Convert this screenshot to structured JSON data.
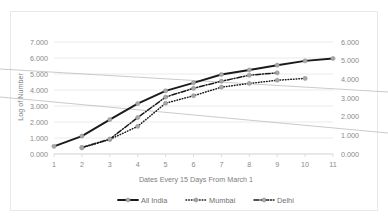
{
  "chart_data": {
    "type": "line",
    "title": "",
    "xlabel": "Dates Every 15 Days From March 1",
    "ylabel": "Log of Number",
    "y2label": "",
    "x": [
      1,
      2,
      3,
      4,
      5,
      6,
      7,
      8,
      9,
      10,
      11
    ],
    "categories": [
      "1",
      "2",
      "3",
      "4",
      "5",
      "6",
      "7",
      "8",
      "9",
      "10",
      "11"
    ],
    "xlim": [
      1,
      11
    ],
    "ylim": [
      0,
      7
    ],
    "y2lim": [
      0,
      6
    ],
    "ytick_labels": [
      "0.000",
      "1.000",
      "2.000",
      "3.000",
      "4.000",
      "5.000",
      "6.000",
      "7.000"
    ],
    "ytick_values": [
      0,
      1,
      2,
      3,
      4,
      5,
      6,
      7
    ],
    "y2tick_labels": [
      "0.000",
      "1.000",
      "2.000",
      "3.000",
      "4.000",
      "5.000",
      "6.000"
    ],
    "y2tick_values": [
      0,
      1,
      2,
      3,
      4,
      5,
      6
    ],
    "grid": true,
    "legend_position": "bottom",
    "series": [
      {
        "name": "All India",
        "axis": "left",
        "style": "solid",
        "x": [
          1,
          2,
          3,
          4,
          5,
          6,
          7,
          8,
          9,
          10,
          11
        ],
        "values": [
          0.48,
          1.12,
          2.15,
          3.15,
          3.95,
          4.45,
          4.97,
          5.25,
          5.55,
          5.82,
          5.97
        ]
      },
      {
        "name": "Mumbai",
        "axis": "right",
        "style": "dotted",
        "x": [
          2,
          3,
          4,
          5,
          6,
          7,
          8,
          9,
          10
        ],
        "values": [
          0.33,
          0.78,
          1.48,
          2.72,
          3.12,
          3.58,
          3.78,
          3.95,
          4.05
        ]
      },
      {
        "name": "Delhi",
        "axis": "right",
        "style": "dashdot",
        "x": [
          2,
          3,
          4,
          5,
          6,
          7,
          8,
          9
        ],
        "values": [
          0.35,
          0.8,
          1.95,
          3.05,
          3.52,
          3.9,
          4.22,
          4.35
        ]
      }
    ],
    "overlay_lines": [
      {
        "name": "upper-diagonal",
        "x1_px": 0,
        "y1_px": 69,
        "x2_px": 388,
        "y2_px": 92
      },
      {
        "name": "lower-diagonal",
        "x1_px": 0,
        "y1_px": 97,
        "x2_px": 388,
        "y2_px": 133
      }
    ]
  },
  "legend": {
    "items": [
      {
        "label": "All India",
        "style": "solid"
      },
      {
        "label": "Mumbai",
        "style": "dotted"
      },
      {
        "label": "Delhi",
        "style": "dashdot"
      }
    ]
  }
}
